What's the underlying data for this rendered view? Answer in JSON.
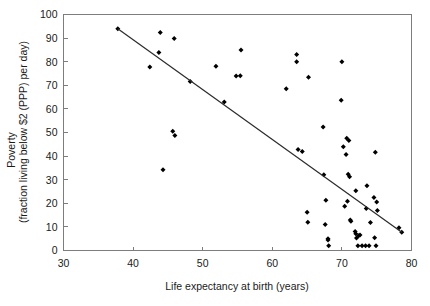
{
  "chart_data": {
    "type": "scatter",
    "title": "",
    "xlabel": "Life expectancy at birth (years)",
    "ylabel_line1": "Poverty",
    "ylabel_line2": "(fraction living below $2 (PPP) per day)",
    "xlim": [
      30,
      80
    ],
    "ylim": [
      0,
      100
    ],
    "xticks": [
      30,
      40,
      50,
      60,
      70,
      80
    ],
    "yticks": [
      0,
      10,
      20,
      30,
      40,
      50,
      60,
      70,
      80,
      90,
      100
    ],
    "xtick_labels": [
      "30",
      "40",
      "50",
      "60",
      "70",
      "80"
    ],
    "ytick_labels": [
      "0",
      "10",
      "20",
      "30",
      "40",
      "50",
      "60",
      "70",
      "80",
      "90",
      "100"
    ],
    "grid": false,
    "legend": null,
    "marker": "filled-diamond",
    "marker_color": "#000000",
    "series": [
      {
        "name": "Countries",
        "points": [
          [
            37.8,
            94.0
          ],
          [
            42.4,
            77.8
          ],
          [
            43.7,
            83.9
          ],
          [
            43.9,
            92.4
          ],
          [
            45.9,
            89.8
          ],
          [
            44.3,
            34.2
          ],
          [
            45.7,
            50.5
          ],
          [
            46.0,
            48.7
          ],
          [
            48.2,
            71.6
          ],
          [
            51.9,
            78.1
          ],
          [
            53.1,
            62.9
          ],
          [
            54.8,
            73.9
          ],
          [
            55.4,
            74.0
          ],
          [
            55.5,
            85.0
          ],
          [
            62.0,
            68.5
          ],
          [
            63.5,
            83.0
          ],
          [
            63.5,
            80.0
          ],
          [
            63.7,
            42.8
          ],
          [
            64.3,
            42.0
          ],
          [
            65.2,
            73.4
          ],
          [
            65.0,
            16.2
          ],
          [
            65.1,
            12.0
          ],
          [
            67.3,
            52.3
          ],
          [
            67.4,
            32.1
          ],
          [
            67.7,
            21.3
          ],
          [
            67.6,
            11.0
          ],
          [
            68.0,
            5.0
          ],
          [
            68.0,
            4.4
          ],
          [
            68.1,
            2.0
          ],
          [
            70.0,
            80.0
          ],
          [
            69.9,
            63.7
          ],
          [
            70.2,
            44.0
          ],
          [
            70.7,
            47.6
          ],
          [
            71.0,
            46.6
          ],
          [
            70.6,
            40.7
          ],
          [
            70.4,
            18.7
          ],
          [
            70.9,
            32.3
          ],
          [
            71.1,
            31.2
          ],
          [
            70.8,
            20.9
          ],
          [
            71.2,
            12.9
          ],
          [
            71.3,
            12.4
          ],
          [
            72.0,
            25.3
          ],
          [
            71.9,
            8.0
          ],
          [
            72.0,
            7.1
          ],
          [
            72.1,
            5.3
          ],
          [
            72.4,
            6.2
          ],
          [
            72.6,
            6.6
          ],
          [
            72.3,
            2.0
          ],
          [
            72.9,
            2.0
          ],
          [
            73.4,
            2.0
          ],
          [
            73.9,
            2.0
          ],
          [
            74.9,
            2.0
          ],
          [
            73.6,
            27.4
          ],
          [
            73.5,
            17.8
          ],
          [
            74.8,
            41.6
          ],
          [
            74.6,
            22.5
          ],
          [
            75.0,
            20.5
          ],
          [
            75.1,
            17.0
          ],
          [
            74.1,
            11.9
          ],
          [
            74.7,
            5.4
          ],
          [
            78.2,
            9.6
          ],
          [
            78.6,
            7.7
          ]
        ]
      }
    ],
    "trend_line": {
      "name": "linear fit",
      "x0": 37.8,
      "y0": 94.0,
      "x1": 78.6,
      "y1": 7.7
    }
  }
}
